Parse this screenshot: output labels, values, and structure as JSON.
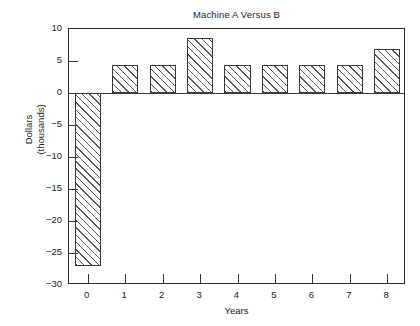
{
  "chart_data": {
    "type": "bar",
    "title": "Machine A Versus B",
    "xlabel": "Years",
    "ylabel": "Dollars (thousands)",
    "ylabel_line1": "Dollars",
    "ylabel_line2": "(thousands)",
    "categories": [
      "0",
      "1",
      "2",
      "3",
      "4",
      "5",
      "6",
      "7",
      "8"
    ],
    "values": [
      -27,
      4.3,
      4.3,
      8.6,
      4.3,
      4.3,
      4.3,
      4.3,
      6.8
    ],
    "ylim": [
      -30,
      10
    ],
    "xlim": [
      -0.5,
      8.5
    ],
    "yticks": [
      10,
      5,
      0,
      -5,
      -10,
      -15,
      -20,
      -25,
      -30
    ],
    "ytick_labels": [
      "10",
      "5",
      "0",
      "−5",
      "−10",
      "−15",
      "−20",
      "−25",
      "−30"
    ],
    "xticks": [
      0,
      1,
      2,
      3,
      4,
      5,
      6,
      7,
      8
    ],
    "xtick_labels": [
      "0",
      "1",
      "2",
      "3",
      "4",
      "5",
      "6",
      "7",
      "8"
    ],
    "grid": false,
    "legend": null,
    "bar_fill": "hatched-45-forward",
    "bar_edge_color": "#3a3a3a",
    "frame_color": "#2b2b2b",
    "background": "#ffffff"
  },
  "figure": {
    "caption_partial": ""
  }
}
